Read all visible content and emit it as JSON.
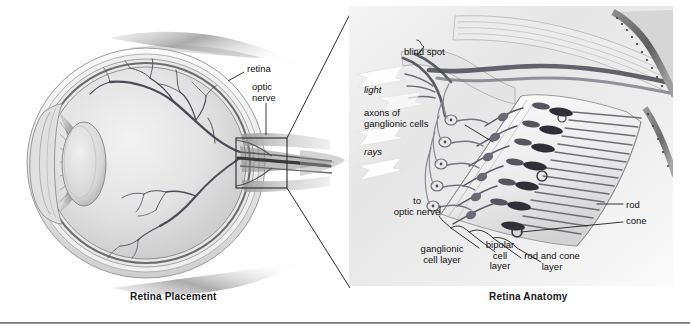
{
  "figure": {
    "width": 690,
    "height": 329,
    "background": "#ffffff",
    "rule_color": "#6f6f6f"
  },
  "panels": [
    {
      "id": "retina-placement",
      "caption": "Retina Placement",
      "subject": "sagittal cross-section of the human eyeball",
      "labels": [
        {
          "name": "retina",
          "text": "retina",
          "x": 247,
          "y": 69,
          "align": "left"
        },
        {
          "name": "optic-nerve",
          "text": "optic\nnerve",
          "x": 252,
          "y": 88,
          "align": "left"
        }
      ],
      "callout_box": {
        "x": 236,
        "y": 138,
        "width": 51,
        "height": 50,
        "stroke": "#2b2b2b"
      }
    },
    {
      "id": "retina-anatomy",
      "caption": "Retina Anatomy",
      "subject": "magnified cutaway of the retinal cell layers at the blind spot",
      "labels": [
        {
          "name": "blind-spot",
          "text": "blind spot",
          "x": 404,
          "y": 52,
          "align": "left"
        },
        {
          "name": "light",
          "text": "light",
          "x": 364,
          "y": 90,
          "align": "left",
          "italic": true
        },
        {
          "name": "axons-of-ganglionic",
          "text": "axons of\nganglionic cells",
          "x": 364,
          "y": 113,
          "align": "left"
        },
        {
          "name": "rays",
          "text": "rays",
          "x": 364,
          "y": 152,
          "align": "left",
          "italic": true
        },
        {
          "name": "to-optic-nerve",
          "text": "to\noptic nerve",
          "x": 392,
          "y": 200,
          "align": "left"
        },
        {
          "name": "ganglionic-cell-layer",
          "text": "ganglionic\ncell layer",
          "x": 419,
          "y": 248,
          "align": "left"
        },
        {
          "name": "bipolar-cell-layer",
          "text": "bipolar\ncell\nlayer",
          "x": 483,
          "y": 244,
          "align": "left"
        },
        {
          "name": "rod-and-cone-layer",
          "text": "rod and cone\nlayer",
          "x": 515,
          "y": 255,
          "align": "left"
        },
        {
          "name": "rod",
          "text": "rod",
          "x": 625,
          "y": 205,
          "align": "left"
        },
        {
          "name": "cone",
          "text": "cone",
          "x": 625,
          "y": 221,
          "align": "left"
        }
      ]
    }
  ],
  "connectors": {
    "note": "two diagonal leader lines joining the callout box in the left panel to the corners of the right panel"
  }
}
